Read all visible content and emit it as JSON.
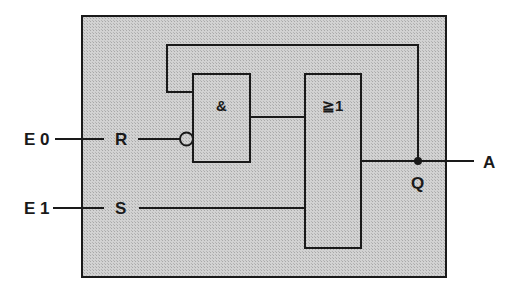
{
  "diagram": {
    "type": "logic-circuit",
    "colors": {
      "module_fill": "#c9c9c9",
      "line": "#1a1a1a",
      "background": "#ffffff"
    },
    "inputs": [
      {
        "id": "E0",
        "label": "E 0",
        "pin_label": "R",
        "inverted": true
      },
      {
        "id": "E1",
        "label": "E 1",
        "pin_label": "S",
        "inverted": false
      }
    ],
    "outputs": [
      {
        "id": "A",
        "label": "A",
        "pin_label": "Q"
      }
    ],
    "gates": [
      {
        "id": "and_gate",
        "symbol": "&",
        "type": "AND"
      },
      {
        "id": "or_gate",
        "symbol": "≧1",
        "type": "OR"
      }
    ],
    "connections": [
      "E0 -> R -> NOT -> AND.in2",
      "Q (feedback) -> AND.in1",
      "AND.out -> OR.in1",
      "E1 -> S -> OR.in2",
      "OR.out -> Q -> A"
    ]
  }
}
